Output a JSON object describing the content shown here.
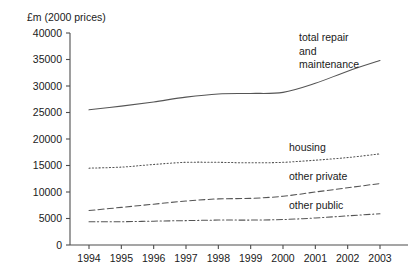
{
  "chart_data": {
    "type": "line",
    "title": "",
    "ylabel": "£m (2000 prices)",
    "xlabel": "",
    "categories": [
      "1994",
      "1995",
      "1996",
      "1997",
      "1998",
      "1999",
      "2000",
      "2001",
      "2002",
      "2003"
    ],
    "x": [
      1994,
      1995,
      1996,
      1997,
      1998,
      1999,
      2000,
      2001,
      2002,
      2003
    ],
    "ylim": [
      0,
      40000
    ],
    "xlim": [
      1994,
      2003
    ],
    "yticks": [
      0,
      5000,
      10000,
      15000,
      20000,
      25000,
      30000,
      35000,
      40000
    ],
    "ytick_labels": [
      "0",
      "5000",
      "10000",
      "15000",
      "20000",
      "25000",
      "30000",
      "35000",
      "40000"
    ],
    "grid": false,
    "legend_position": "inline-annotations",
    "series": [
      {
        "name": "total repair and maintenance",
        "annotation_lines": [
          "total repair",
          "and",
          "maintenance"
        ],
        "style": "solid",
        "color": "#555555",
        "values": [
          25500,
          26200,
          27000,
          27900,
          28500,
          28600,
          28800,
          30500,
          32800,
          34800
        ]
      },
      {
        "name": "housing",
        "annotation_lines": [
          "housing"
        ],
        "style": "dotted",
        "color": "#555555",
        "values": [
          14500,
          14700,
          15200,
          15600,
          15600,
          15500,
          15600,
          16000,
          16500,
          17200
        ]
      },
      {
        "name": "other private",
        "annotation_lines": [
          "other private"
        ],
        "style": "dashed",
        "color": "#555555",
        "values": [
          6500,
          7100,
          7700,
          8300,
          8700,
          8800,
          9200,
          10000,
          10800,
          11600
        ]
      },
      {
        "name": "other public",
        "annotation_lines": [
          "other public"
        ],
        "style": "dash-dot",
        "color": "#555555",
        "values": [
          4400,
          4400,
          4500,
          4600,
          4700,
          4700,
          4800,
          5100,
          5500,
          5900
        ]
      }
    ]
  }
}
